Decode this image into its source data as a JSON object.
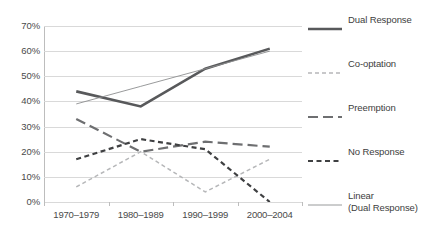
{
  "chart_data": {
    "type": "line",
    "title": "",
    "subtitle": "",
    "xlabel": "",
    "ylabel": "",
    "categories": [
      "1970–1979",
      "1980–1989",
      "1990–1999",
      "2000–2004"
    ],
    "ylim": [
      0,
      70
    ],
    "ytick_labels": [
      "70%",
      "60%",
      "50%",
      "40%",
      "30%",
      "20%",
      "10%",
      "0%"
    ],
    "ytick_values": [
      70,
      60,
      50,
      40,
      30,
      20,
      10,
      0
    ],
    "grid": true,
    "legend_position": "right",
    "series": [
      {
        "name": "Dual Response",
        "values": [
          44,
          38,
          53,
          61
        ],
        "color": "#58595b",
        "style": "solid",
        "width": 2.6
      },
      {
        "name": "Co-optation",
        "values": [
          6,
          20,
          4,
          17
        ],
        "color": "#b6b7b9",
        "style": "dotted-fine",
        "width": 1.5
      },
      {
        "name": "Preemption",
        "values": [
          33,
          20,
          24,
          22
        ],
        "color": "#6e6f71",
        "style": "long-dash",
        "width": 2.2
      },
      {
        "name": "No Response",
        "values": [
          17,
          25,
          21,
          0
        ],
        "color": "#3f4042",
        "style": "short-dash",
        "width": 2.2
      },
      {
        "name": "Linear (Dual Response)",
        "values": [
          39,
          46,
          53,
          60
        ],
        "color": "#8d8e90",
        "style": "solid-thin",
        "width": 0.9,
        "trendline": true
      }
    ]
  },
  "legend": {
    "items": [
      {
        "label": "Dual Response",
        "label_line2": "",
        "swatch": "solid-thick-swatch"
      },
      {
        "label": "Co-optation",
        "label_line2": "",
        "swatch": "fine-dash-swatch"
      },
      {
        "label": "Preemption",
        "label_line2": "",
        "swatch": "long-dash-swatch"
      },
      {
        "label": "No Response",
        "label_line2": "",
        "swatch": "short-dash-swatch"
      },
      {
        "label": "Linear",
        "label_line2": "(Dual Response)",
        "swatch": "thin-line-swatch"
      }
    ]
  },
  "colors": {
    "gridline": "#d9d9d9",
    "axis": "#bdbdbd",
    "text": "#4a4a4a",
    "background": "#ffffff"
  }
}
